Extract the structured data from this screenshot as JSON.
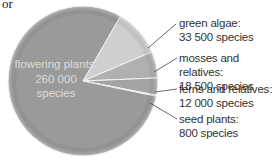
{
  "header": {
    "corner_text": "or"
  },
  "chart_data": {
    "type": "pie",
    "title": "",
    "categories": [
      "flowering plants",
      "green algae",
      "mosses and relatives",
      "ferns and relatives",
      "seed plants"
    ],
    "values": [
      260000,
      33500,
      18500,
      12000,
      800
    ],
    "units": "species",
    "labels": [
      {
        "name": "flowering plants:",
        "value": "260 000",
        "unit": "species"
      },
      {
        "name": "green algae:",
        "value": "33 500 species"
      },
      {
        "name": "mosses and relatives:",
        "value": "18 500 species"
      },
      {
        "name": "ferns and relatives:",
        "value": "12 000 species"
      },
      {
        "name": "seed plants:",
        "value": "800 species"
      }
    ],
    "colors": [
      "#9a9a9a",
      "#cfcfcf",
      "#b0b0b0",
      "#a4a4a4",
      "#bcbcbc"
    ],
    "legend": "callout labels on right"
  }
}
